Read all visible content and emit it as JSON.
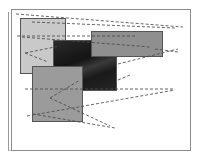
{
  "diagram": {
    "panels": [
      {
        "name": "light-panel",
        "x": 20,
        "y": 18,
        "w": 46,
        "h": 56,
        "color": "#c9c9c9"
      },
      {
        "name": "dark-photo-panel",
        "x": 53,
        "y": 40,
        "w": 64,
        "h": 51,
        "color": "#1e1e1e"
      },
      {
        "name": "top-right-panel",
        "x": 91,
        "y": 31,
        "w": 72,
        "h": 26,
        "color": "#8f8f8f"
      },
      {
        "name": "bottom-left-panel",
        "x": 32,
        "y": 66,
        "w": 51,
        "h": 56,
        "color": "#9b9b9b"
      }
    ],
    "dashed_color": "#555555"
  }
}
